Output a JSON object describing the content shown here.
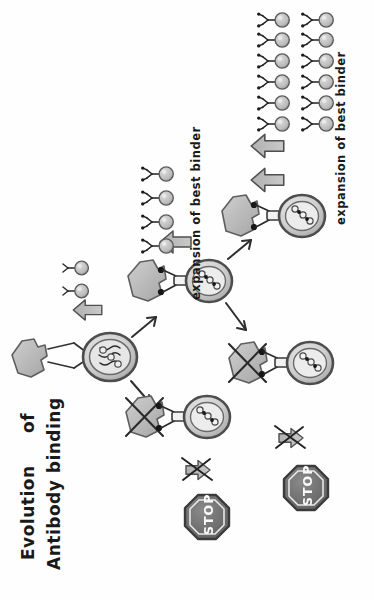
{
  "figure": {
    "kind": "hand-drawn-diagram",
    "title_line1": "Evolution",
    "title_line2": "of",
    "title_line3": "Antibody binding",
    "background_color": "#fefefe",
    "ink_color": "#1a1a1a",
    "fill_light": "#d8d8d8",
    "fill_mid": "#b8b8b8",
    "fill_dark": "#8f8f8f",
    "stop_fill": "#6e6e6e"
  },
  "labels": {
    "expansion_1": "expansion of best binder",
    "expansion_2": "expansion of best binder"
  },
  "stops": [
    {
      "text": "STOP",
      "id": "stop-sign-lower-left"
    },
    {
      "text": "STOP",
      "id": "stop-sign-lower-right"
    }
  ],
  "generations": [
    {
      "id": "generation-1",
      "name": "founder-cell",
      "antigen": "unmutated",
      "binding": "weak",
      "mutations": 0,
      "outcome": "expands-slightly"
    },
    {
      "id": "generation-2-success",
      "name": "improved-binder-cell",
      "antigen": "bound",
      "binding": "improved",
      "mutations": 2,
      "outcome": "expands"
    },
    {
      "id": "generation-2-fail",
      "name": "failed-binder-cell-lower",
      "antigen": "crossed-out",
      "binding": "lost",
      "mutations": 2,
      "outcome": "stop"
    },
    {
      "id": "generation-3-success",
      "name": "best-binder-cell",
      "antigen": "bound",
      "binding": "best",
      "mutations": 2,
      "outcome": "expands-strongly"
    },
    {
      "id": "generation-3-fail",
      "name": "failed-binder-cell-right",
      "antigen": "crossed-out",
      "binding": "lost",
      "mutations": 2,
      "outcome": "stop"
    }
  ],
  "clones": [
    {
      "id": "clone-group-small",
      "count": 2,
      "rows": 2,
      "cols": 1
    },
    {
      "id": "clone-group-medium",
      "count": 4,
      "rows": 4,
      "cols": 1
    },
    {
      "id": "clone-group-large",
      "count": 12,
      "rows": 6,
      "cols": 2
    }
  ],
  "arrows": {
    "expand_single_1": "single-up-arrow",
    "expand_single_2": "single-up-arrow",
    "expand_double": "double-up-arrow",
    "branch_up": "thin-diagonal-arrow-up",
    "branch_down": "thin-diagonal-arrow-down",
    "blocked_1": "crossed-out-down-arrow",
    "blocked_2": "crossed-out-down-arrow"
  }
}
